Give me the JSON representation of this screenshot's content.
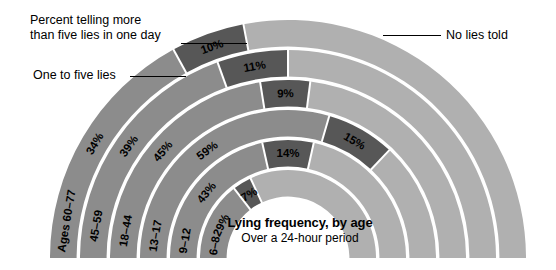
{
  "annotations": {
    "more_than_five": "Percent telling more\nthan five lies in one day",
    "more_than_five_line1": "Percent telling more",
    "more_than_five_line2": "than five lies in one day",
    "one_to_five": "One to five lies",
    "no_lies": "No lies told"
  },
  "title": {
    "main": "Lying frequency, by age",
    "sub": "Over a 24-hour period"
  },
  "colors": {
    "one_to_five": "#8c8c8c",
    "more_than_five": "#575757",
    "no_lies": "#b0b0b0",
    "separator": "#ffffff",
    "text_dark": "#000000",
    "background": "#ffffff"
  },
  "chart_data": {
    "type": "pie",
    "title": "Lying frequency, by age",
    "subtitle": "Over a 24-hour period",
    "layout": "concentric half-donut, outermost ring = oldest age group",
    "categories": [
      "Ages 60–77",
      "45–59",
      "18–44",
      "13–17",
      "9–12",
      "6–8"
    ],
    "series": [
      {
        "name": "One to five lies",
        "color": "#8c8c8c",
        "values": [
          34,
          39,
          45,
          59,
          43,
          29
        ]
      },
      {
        "name": "Percent telling more than five lies in one day",
        "color": "#575757",
        "values": [
          10,
          11,
          9,
          15,
          14,
          7
        ]
      },
      {
        "name": "No lies told",
        "color": "#b0b0b0",
        "values": [
          56,
          50,
          46,
          26,
          43,
          64
        ]
      }
    ],
    "labeled_values": [
      {
        "ring": "Ages 60–77",
        "one_to_five": "34%",
        "more_than_five": "10%"
      },
      {
        "ring": "45–59",
        "one_to_five": "39%",
        "more_than_five": "11%"
      },
      {
        "ring": "18–44",
        "one_to_five": "45%",
        "more_than_five": "9%"
      },
      {
        "ring": "13–17",
        "one_to_five": "59%",
        "more_than_five": "15%"
      },
      {
        "ring": "9–12",
        "one_to_five": "43%",
        "more_than_five": "14%"
      },
      {
        "ring": "6–8",
        "one_to_five": "29%",
        "more_than_five": "7%"
      }
    ],
    "legend": [
      "Percent telling more than five lies in one day",
      "One to five lies",
      "No lies told"
    ],
    "legend_position": "leader-lines at left and right"
  },
  "rings": [
    {
      "label": "Ages 60–77",
      "pct_one": "34%",
      "pct_more": "10%"
    },
    {
      "label": "45–59",
      "pct_one": "39%",
      "pct_more": "11%"
    },
    {
      "label": "18–44",
      "pct_one": "45%",
      "pct_more": "9%"
    },
    {
      "label": "13–17",
      "pct_one": "59%",
      "pct_more": "15%"
    },
    {
      "label": "9–12",
      "pct_one": "43%",
      "pct_more": "14%"
    },
    {
      "label": "6–8",
      "pct_one": "29%",
      "pct_more": "7%"
    }
  ]
}
